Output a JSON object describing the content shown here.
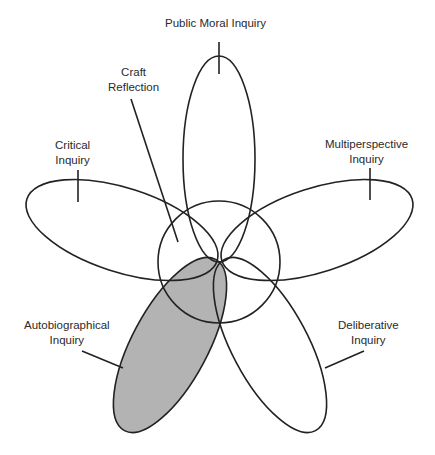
{
  "diagram": {
    "type": "five-petal flower diagram",
    "center": {
      "name": "Craft Reflection",
      "shape": "circle"
    },
    "petals": [
      {
        "id": "public-moral",
        "label": "Public Moral Inquiry",
        "filled": false
      },
      {
        "id": "multiperspective",
        "label_line1": "Multiperspective",
        "label_line2": "Inquiry",
        "filled": false
      },
      {
        "id": "deliberative",
        "label_line1": "Deliberative",
        "label_line2": "Inquiry",
        "filled": false
      },
      {
        "id": "autobiographical",
        "label_line1": "Autobiographical",
        "label_line2": "Inquiry",
        "filled": true,
        "fill": "#b3b3b3"
      },
      {
        "id": "critical",
        "label_line1": "Critical",
        "label_line2": "Inquiry",
        "filled": false
      }
    ],
    "craft": {
      "label_line1": "Craft",
      "label_line2": "Reflection"
    },
    "colors": {
      "stroke": "#222222",
      "fill_highlight": "#b3b3b3",
      "background": "#ffffff"
    }
  }
}
